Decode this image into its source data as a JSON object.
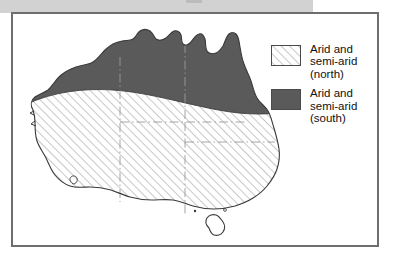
{
  "figure": {
    "kind": "thematic-map",
    "border_color": "#6e6e6e",
    "background_color": "#ffffff"
  },
  "scan_artifact": {
    "banner_color": "#d2d2d2",
    "notch_color": "#bcbcbc",
    "fleck_color": "#c8c8c8"
  },
  "map": {
    "coastline_color": "#3a3a3a",
    "state_border_color": "#9a9a9a",
    "regions": [
      {
        "id": "arid-semi-arid-north",
        "label": "Arid and semi-arid (north)",
        "fill_style": "diagonal-hatch",
        "fill_color": "#ffffff",
        "hatch_color": "#9a9a9a"
      },
      {
        "id": "arid-semi-arid-south",
        "label": "Arid and semi-arid (south)",
        "fill_style": "solid",
        "fill_color": "#5a5a5a"
      }
    ],
    "features": [
      "mainland",
      "tasmania",
      "cape-york",
      "gulf-of-carpentaria",
      "great-australian-bight",
      "state-boundaries"
    ]
  },
  "legend": {
    "items": [
      {
        "swatch": "hatch-swatch",
        "label": "Arid and\nsemi-arid\n(north)",
        "color": "#ffffff"
      },
      {
        "swatch": "solid-swatch",
        "label": "Arid and\nsemi-arid\n(south)",
        "color": "#5a5a5a"
      }
    ]
  }
}
